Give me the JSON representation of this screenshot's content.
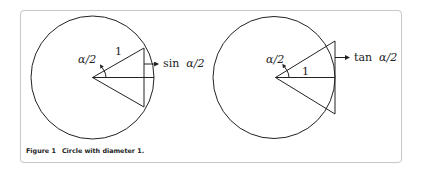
{
  "figure": {
    "label": "Figure 1",
    "caption": "Circle with diameter 1.",
    "panels": [
      {
        "name": "sine-panel",
        "angle_label": "α/2",
        "radius_label": "1",
        "segment_label_func": "sin",
        "segment_label_arg": "α/2"
      },
      {
        "name": "tangent-panel",
        "angle_label": "α/2",
        "radius_label": "1",
        "segment_label_func": "tan",
        "segment_label_arg": "α/2"
      }
    ]
  }
}
